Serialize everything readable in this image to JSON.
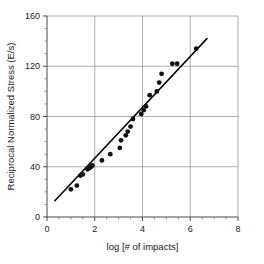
{
  "chart_data": {
    "type": "scatter",
    "title": "",
    "xlabel": "log [# of impacts]",
    "ylabel": "Reciprocal Normalized Stress (E/s)",
    "xlim": [
      0,
      8
    ],
    "ylim": [
      0,
      160
    ],
    "xticks": [
      0,
      2,
      4,
      6,
      8
    ],
    "xtick_labels": [
      "0",
      "2",
      "4",
      "6",
      "8"
    ],
    "yticks": [
      0,
      40,
      80,
      120,
      160
    ],
    "ytick_labels": [
      "0",
      "40",
      "80",
      "120",
      "160"
    ],
    "x_minor_step": 0.5,
    "y_minor_step": 10,
    "grid": "major-both",
    "legend": "none",
    "marker": "filled-circle",
    "marker_color": "#111111",
    "points": [
      {
        "x": 1.0,
        "y": 22
      },
      {
        "x": 1.25,
        "y": 25
      },
      {
        "x": 1.4,
        "y": 33
      },
      {
        "x": 1.5,
        "y": 34
      },
      {
        "x": 1.7,
        "y": 38
      },
      {
        "x": 1.78,
        "y": 39
      },
      {
        "x": 1.85,
        "y": 40
      },
      {
        "x": 1.9,
        "y": 41
      },
      {
        "x": 2.3,
        "y": 45
      },
      {
        "x": 2.65,
        "y": 50
      },
      {
        "x": 3.05,
        "y": 55
      },
      {
        "x": 3.1,
        "y": 61
      },
      {
        "x": 3.3,
        "y": 65
      },
      {
        "x": 3.38,
        "y": 68
      },
      {
        "x": 3.5,
        "y": 72
      },
      {
        "x": 3.6,
        "y": 78
      },
      {
        "x": 3.95,
        "y": 82
      },
      {
        "x": 4.05,
        "y": 85
      },
      {
        "x": 4.15,
        "y": 88
      },
      {
        "x": 4.3,
        "y": 97
      },
      {
        "x": 4.6,
        "y": 100
      },
      {
        "x": 4.7,
        "y": 107
      },
      {
        "x": 4.8,
        "y": 114
      },
      {
        "x": 5.25,
        "y": 122
      },
      {
        "x": 5.45,
        "y": 122
      },
      {
        "x": 6.25,
        "y": 134
      }
    ],
    "fit_line": {
      "type": "linear",
      "x_start": 0.33,
      "y_start": 13,
      "x_end": 6.7,
      "y_end": 142
    }
  }
}
